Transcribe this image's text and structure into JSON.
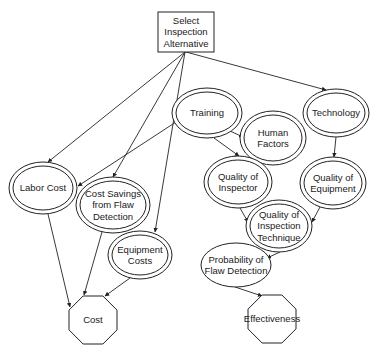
{
  "diagram": {
    "colors": {
      "stroke": "#222222",
      "fill": "#ffffff",
      "text": "#1a1a1a"
    },
    "nodes": [
      {
        "id": "decision",
        "type": "decision",
        "shape": "rect",
        "x": 158,
        "y": 12,
        "w": 56,
        "h": 40,
        "lines": [
          "Select",
          "Inspection",
          "Alternative"
        ]
      },
      {
        "id": "labor_cost",
        "type": "deterministic",
        "shape": "double-ellipse",
        "cx": 43,
        "cy": 188,
        "rx": 34,
        "ry": 26,
        "lines": [
          "Labor Cost"
        ]
      },
      {
        "id": "cost_savings",
        "type": "deterministic",
        "shape": "double-ellipse",
        "cx": 113,
        "cy": 205,
        "rx": 37,
        "ry": 28,
        "lines": [
          "Cost Savings",
          "from Flaw",
          "Detection"
        ]
      },
      {
        "id": "equipment_costs",
        "type": "deterministic",
        "shape": "double-ellipse",
        "cx": 140,
        "cy": 255,
        "rx": 32,
        "ry": 24,
        "lines": [
          "Equipment",
          "Costs"
        ]
      },
      {
        "id": "training",
        "type": "deterministic",
        "shape": "double-ellipse",
        "cx": 207,
        "cy": 113,
        "rx": 35,
        "ry": 25,
        "lines": [
          "Training"
        ]
      },
      {
        "id": "human_factors",
        "type": "deterministic",
        "shape": "double-ellipse",
        "cx": 273,
        "cy": 138,
        "rx": 33,
        "ry": 27,
        "lines": [
          "Human",
          "Factors"
        ]
      },
      {
        "id": "technology",
        "type": "deterministic",
        "shape": "double-ellipse",
        "cx": 336,
        "cy": 113,
        "rx": 33,
        "ry": 24,
        "lines": [
          "Technology"
        ]
      },
      {
        "id": "quality_inspector",
        "type": "deterministic",
        "shape": "double-ellipse",
        "cx": 238,
        "cy": 182,
        "rx": 34,
        "ry": 26,
        "lines": [
          "Quality of",
          "Inspector"
        ]
      },
      {
        "id": "quality_equipment",
        "type": "deterministic",
        "shape": "double-ellipse",
        "cx": 333,
        "cy": 183,
        "rx": 33,
        "ry": 26,
        "lines": [
          "Quality of",
          "Equipment"
        ]
      },
      {
        "id": "quality_technique",
        "type": "deterministic",
        "shape": "double-ellipse",
        "cx": 279,
        "cy": 226,
        "rx": 33,
        "ry": 26,
        "lines": [
          "Quality of",
          "Inspection",
          "Technique"
        ]
      },
      {
        "id": "prob_detection",
        "type": "chance",
        "shape": "ellipse",
        "cx": 236,
        "cy": 265,
        "rx": 35,
        "ry": 22,
        "lines": [
          "Probability of",
          "Flaw Detection"
        ]
      },
      {
        "id": "cost",
        "type": "value",
        "shape": "octagon",
        "cx": 93,
        "cy": 320,
        "r": 26,
        "lines": [
          "Cost"
        ]
      },
      {
        "id": "effectiveness",
        "type": "value",
        "shape": "octagon",
        "cx": 272,
        "cy": 319,
        "r": 26,
        "lines": [
          "Effectiveness"
        ]
      }
    ],
    "edges": [
      {
        "from": "decision",
        "to": "labor_cost",
        "x1": 185,
        "y1": 52,
        "x2": 48,
        "y2": 162
      },
      {
        "from": "decision",
        "to": "cost_savings",
        "x1": 185,
        "y1": 52,
        "x2": 113,
        "y2": 177
      },
      {
        "from": "decision",
        "to": "equipment_costs",
        "x1": 185,
        "y1": 52,
        "x2": 155,
        "y2": 232
      },
      {
        "from": "decision",
        "to": "technology",
        "x1": 186,
        "y1": 52,
        "x2": 326,
        "y2": 90
      },
      {
        "from": "training",
        "to": "labor_cost",
        "x1": 176,
        "y1": 122,
        "x2": 78,
        "y2": 186
      },
      {
        "from": "training",
        "to": "human_factors",
        "x1": 230,
        "y1": 131,
        "x2": 243,
        "y2": 137
      },
      {
        "from": "training",
        "to": "quality_inspector",
        "x1": 214,
        "y1": 138,
        "x2": 239,
        "y2": 156
      },
      {
        "from": "human_factors",
        "to": "quality_inspector",
        "x1": 262,
        "y1": 164,
        "x2": 240,
        "y2": 157
      },
      {
        "from": "technology",
        "to": "quality_equipment",
        "x1": 336,
        "y1": 137,
        "x2": 334,
        "y2": 157
      },
      {
        "from": "quality_inspector",
        "to": "quality_technique",
        "x1": 240,
        "y1": 208,
        "x2": 248,
        "y2": 222
      },
      {
        "from": "quality_equipment",
        "to": "quality_technique",
        "x1": 320,
        "y1": 207,
        "x2": 312,
        "y2": 222
      },
      {
        "from": "quality_technique",
        "to": "prob_detection",
        "x1": 280,
        "y1": 252,
        "x2": 267,
        "y2": 258
      },
      {
        "from": "prob_detection",
        "to": "effectiveness",
        "x1": 235,
        "y1": 287,
        "x2": 262,
        "y2": 296
      },
      {
        "from": "labor_cost",
        "to": "cost",
        "x1": 48,
        "y1": 214,
        "x2": 70,
        "y2": 307
      },
      {
        "from": "cost_savings",
        "to": "cost",
        "x1": 102,
        "y1": 232,
        "x2": 84,
        "y2": 295
      },
      {
        "from": "equipment_costs",
        "to": "cost",
        "x1": 130,
        "y1": 278,
        "x2": 105,
        "y2": 296
      }
    ]
  }
}
